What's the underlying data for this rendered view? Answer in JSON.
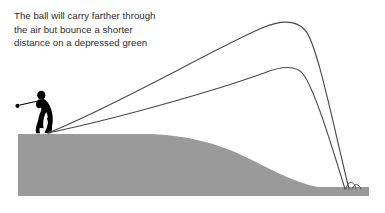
{
  "figure": {
    "width": 385,
    "height": 213,
    "background_color": "#ffffff"
  },
  "caption": {
    "line1": "The ball will carry farther through",
    "line2": "the air but bounce a shorter",
    "line3": "distance on a depressed green",
    "full_text": "The ball will carry farther through\nthe air but bounce a shorter\ndistance on a depressed green",
    "color": "#2b2b2b",
    "font_size_px": 9.6
  },
  "colors": {
    "terrain_gray": "#9a9a9a",
    "trajectory_line": "#4a4a4a",
    "golfer_silhouette": "#000000",
    "text": "#2b2b2b",
    "background": "#ffffff"
  },
  "golfer": {
    "label": "golfer-silhouette",
    "pose": "follow-through",
    "color": "#000000",
    "stance_x": 40,
    "stance_y": 133,
    "club_head_x": 14,
    "club_head_y": 104
  },
  "terrain": {
    "label": "terrain-cross-section",
    "color": "#9a9a9a",
    "tee_plateau_top_y": 134,
    "green_surface_y": 188,
    "base_y": 196,
    "slope_start_x": 150,
    "slope_end_x": 318,
    "description": "Elevated tee plateau on the left falling away to a depressed green on the right"
  },
  "trajectories": [
    {
      "id": "upper-trajectory",
      "label": "Longer carry trajectory",
      "origin": {
        "x": 48,
        "y": 133
      },
      "apex": {
        "x": 288,
        "y": 23
      },
      "landing": {
        "x": 349,
        "y": 189
      },
      "bounce_distance": "shorter",
      "stroke": "#4a4a4a",
      "stroke_width": 1.1
    },
    {
      "id": "lower-trajectory",
      "label": "Lower flatter trajectory",
      "origin": {
        "x": 48,
        "y": 133
      },
      "apex": {
        "x": 292,
        "y": 68
      },
      "landing": {
        "x": 345,
        "y": 189
      },
      "bounce_distance": "shorter",
      "stroke": "#4a4a4a",
      "stroke_width": 1.1
    }
  ],
  "bounces": [
    {
      "id": "bounce-arc-1",
      "start_x": 346,
      "end_x": 355,
      "ground_y": 189,
      "peak_y": 181
    },
    {
      "id": "bounce-arc-2",
      "start_x": 352,
      "end_x": 360,
      "ground_y": 189,
      "peak_y": 184
    }
  ]
}
